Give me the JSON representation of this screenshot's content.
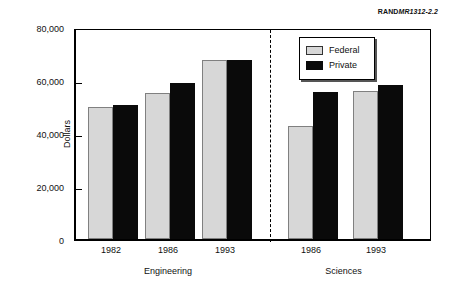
{
  "report_id": {
    "bold_part": "RAND",
    "italic_part": "MR1312-2.2"
  },
  "chart_data": {
    "type": "bar",
    "title": "",
    "xlabel": "",
    "ylabel": "Dollars",
    "ylim": [
      0,
      80000
    ],
    "ytick_labels": [
      "0",
      "20,000",
      "40,000",
      "60,000",
      "80,000"
    ],
    "ytick_values": [
      0,
      20000,
      40000,
      60000,
      80000
    ],
    "grid": false,
    "legend_position": "top-right-inside",
    "categories": [
      "1982",
      "1986",
      "1993",
      "1986",
      "1993"
    ],
    "groups": [
      {
        "name": "Engineering",
        "categories": [
          "1982",
          "1986",
          "1993"
        ]
      },
      {
        "name": "Sciences",
        "categories": [
          "1986",
          "1993"
        ]
      }
    ],
    "series": [
      {
        "name": "Federal",
        "color": "#d7d7d7",
        "values": [
          49800,
          55100,
          67500,
          42600,
          55800
        ]
      },
      {
        "name": "Private",
        "color": "#0a0a0a",
        "values": [
          50600,
          59000,
          67500,
          55500,
          58100
        ]
      }
    ],
    "annotations": [
      {
        "type": "divider",
        "style": "dashed",
        "between": [
          "Engineering",
          "Sciences"
        ]
      }
    ]
  }
}
